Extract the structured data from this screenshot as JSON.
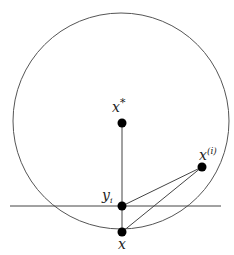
{
  "diagram": {
    "circle": {
      "cx": 121,
      "cy": 121,
      "r": 108,
      "stroke": "#555555"
    },
    "horizontal_line": {
      "x1": 10,
      "y1": 206,
      "x2": 221,
      "y2": 206
    },
    "points": {
      "x_star": {
        "label": "x",
        "sup": "*",
        "cx": 122,
        "cy": 123
      },
      "x_i": {
        "label": "x",
        "sup": "(i)",
        "cx": 202,
        "cy": 167
      },
      "y_i": {
        "label": "y",
        "sub": "i",
        "cx": 122,
        "cy": 206
      },
      "x": {
        "label": "x",
        "cx": 122,
        "cy": 232
      }
    }
  }
}
